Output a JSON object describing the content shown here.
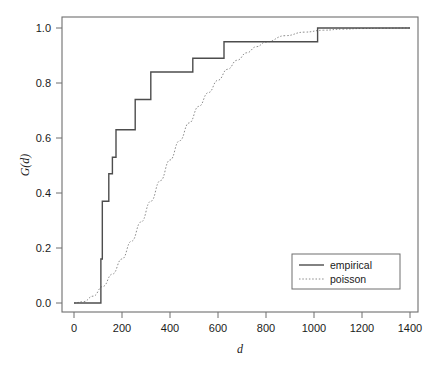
{
  "chart_data": {
    "type": "line",
    "title": "",
    "subtitle": "",
    "xlabel": "d",
    "ylabel": "G(d)",
    "xlim": [
      -40,
      1440
    ],
    "ylim": [
      -0.04,
      1.04
    ],
    "grid": false,
    "legend_position": "bottom-right",
    "xticks": [
      0,
      200,
      400,
      600,
      800,
      1000,
      1200,
      1400
    ],
    "xtick_labels": [
      "0",
      "200",
      "400",
      "600",
      "800",
      "1000",
      "1200",
      "1400"
    ],
    "yticks": [
      0.0,
      0.2,
      0.4,
      0.6,
      0.8,
      1.0
    ],
    "ytick_labels": [
      "0.0",
      "0.2",
      "0.4",
      "0.6",
      "0.8",
      "1.0"
    ],
    "series": [
      {
        "name": "empirical",
        "style": "step",
        "linestyle": "solid",
        "color": "#4d4d4d",
        "x": [
          0,
          105,
          112,
          118,
          125,
          145,
          160,
          175,
          255,
          320,
          495,
          625,
          1015,
          1400
        ],
        "y": [
          0.0,
          0.0,
          0.16,
          0.37,
          0.37,
          0.47,
          0.53,
          0.63,
          0.74,
          0.84,
          0.89,
          0.95,
          1.0,
          1.0
        ]
      },
      {
        "name": "poisson",
        "style": "curve",
        "linestyle": "dotted",
        "color": "#8c8c8c",
        "x": [
          0,
          40,
          80,
          120,
          160,
          200,
          240,
          280,
          320,
          360,
          400,
          440,
          480,
          520,
          560,
          600,
          640,
          680,
          720,
          760,
          800,
          880,
          960,
          1040,
          1120,
          1200,
          1280,
          1400
        ],
        "y": [
          0.0,
          0.005,
          0.025,
          0.06,
          0.105,
          0.16,
          0.225,
          0.295,
          0.37,
          0.445,
          0.52,
          0.59,
          0.655,
          0.715,
          0.765,
          0.81,
          0.85,
          0.883,
          0.91,
          0.932,
          0.949,
          0.972,
          0.985,
          0.992,
          0.996,
          0.998,
          0.999,
          1.0
        ]
      }
    ],
    "legend_entries": [
      {
        "label": "empirical",
        "linestyle": "solid",
        "color": "#4d4d4d"
      },
      {
        "label": "poisson",
        "linestyle": "dotted",
        "color": "#8c8c8c"
      }
    ]
  },
  "axes": {
    "frame_color": "#6e6e6e",
    "background": "#ffffff"
  }
}
